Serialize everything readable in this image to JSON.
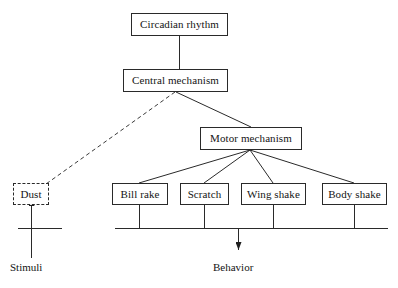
{
  "page": {
    "corner_header": "",
    "background": "#ffffff",
    "line_color": "#2a2a2a"
  },
  "diagram": {
    "nodes": [
      {
        "id": "circadian",
        "label": "Circadian rhythm",
        "style": "solid",
        "x": 131,
        "y": 13,
        "w": 97,
        "h": 23
      },
      {
        "id": "central",
        "label": "Central mechanism",
        "style": "solid",
        "x": 123,
        "y": 69,
        "w": 105,
        "h": 23
      },
      {
        "id": "motor",
        "label": "Motor mechanism",
        "style": "solid",
        "x": 200,
        "y": 127,
        "w": 102,
        "h": 23
      },
      {
        "id": "dust",
        "label": "Dust",
        "style": "dashed",
        "x": 13,
        "y": 183,
        "w": 36,
        "h": 22
      },
      {
        "id": "bill_rake",
        "label": "Bill rake",
        "style": "solid",
        "x": 112,
        "y": 183,
        "w": 56,
        "h": 22
      },
      {
        "id": "scratch",
        "label": "Scratch",
        "style": "solid",
        "x": 180,
        "y": 183,
        "w": 49,
        "h": 22
      },
      {
        "id": "wing_shake",
        "label": "Wing shake",
        "style": "solid",
        "x": 241,
        "y": 183,
        "w": 65,
        "h": 22
      },
      {
        "id": "body_shake",
        "label": "Body shake",
        "style": "solid",
        "x": 322,
        "y": 183,
        "w": 65,
        "h": 22
      }
    ],
    "edges": [
      {
        "from": "circadian",
        "to": "central",
        "style": "solid",
        "kind": "vertical"
      },
      {
        "from": "central",
        "to": "motor",
        "style": "solid",
        "kind": "diagonal"
      },
      {
        "from": "central",
        "to": "dust",
        "style": "dashed",
        "kind": "diagonal"
      },
      {
        "from": "motor",
        "to": "bill_rake",
        "style": "solid",
        "kind": "fan"
      },
      {
        "from": "motor",
        "to": "scratch",
        "style": "solid",
        "kind": "fan"
      },
      {
        "from": "motor",
        "to": "wing_shake",
        "style": "solid",
        "kind": "fan"
      },
      {
        "from": "motor",
        "to": "body_shake",
        "style": "solid",
        "kind": "fan"
      }
    ],
    "axis_labels": [
      {
        "id": "stimuli",
        "label": "Stimuli",
        "arrow": "up",
        "x": 10,
        "y": 262
      },
      {
        "id": "behavior",
        "label": "Behavior",
        "arrow": "down",
        "x": 213,
        "y": 262
      }
    ],
    "input_bar": {
      "x1": 18,
      "x2": 62,
      "y": 228
    },
    "output_bar": {
      "x1": 115,
      "x2": 388,
      "y": 228
    }
  }
}
